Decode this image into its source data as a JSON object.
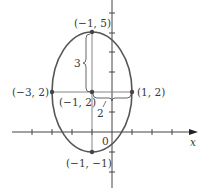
{
  "figure": {
    "type": "ellipse-diagram",
    "colors": {
      "curve": "#555555",
      "axis": "#444444",
      "line": "#777777",
      "text": "#3a3a3a"
    },
    "axes": {
      "x_label": "x",
      "origin_label": "0"
    },
    "ellipse": {
      "center": [
        -1,
        2
      ],
      "semi_major": 3,
      "semi_minor": 2,
      "orientation": "vertical"
    },
    "points": [
      {
        "id": "top",
        "coords": [
          -1,
          5
        ],
        "label": "(−1, 5)"
      },
      {
        "id": "center",
        "coords": [
          -1,
          2
        ],
        "label": "(−1, 2)"
      },
      {
        "id": "left",
        "coords": [
          -3,
          2
        ],
        "label": "(−3, 2)"
      },
      {
        "id": "right",
        "coords": [
          1,
          2
        ],
        "label": "(1, 2)"
      },
      {
        "id": "bottom",
        "coords": [
          -1,
          -1
        ],
        "label": "(−1, −1)"
      }
    ],
    "dimensions": [
      {
        "id": "vertical",
        "label": "3"
      },
      {
        "id": "horizontal",
        "label": "2"
      }
    ]
  }
}
